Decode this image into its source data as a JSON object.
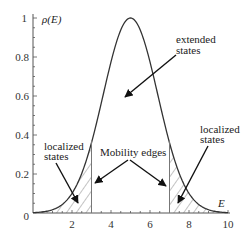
{
  "chart_data": {
    "type": "line",
    "title": "",
    "xlabel": "E",
    "ylabel": "ρ(E)",
    "xlim": [
      0,
      10
    ],
    "ylim": [
      0,
      1
    ],
    "x_ticks": [
      "2",
      "4",
      "6",
      "8",
      "10"
    ],
    "y_ticks": [
      "0",
      "0.2",
      "0.4",
      "0.6",
      "0.8",
      "1"
    ],
    "grid": false,
    "legend": null,
    "series": [
      {
        "name": "density of states",
        "x": [
          0,
          0.5,
          1,
          1.5,
          2,
          2.5,
          3,
          3.5,
          4,
          4.5,
          5,
          5.5,
          6,
          6.5,
          7,
          7.5,
          8,
          8.5,
          9,
          9.5,
          10
        ],
        "values": [
          0.002,
          0.006,
          0.017,
          0.044,
          0.101,
          0.203,
          0.36,
          0.563,
          0.775,
          0.938,
          1.0,
          0.938,
          0.775,
          0.563,
          0.36,
          0.203,
          0.101,
          0.044,
          0.017,
          0.006,
          0.002
        ]
      }
    ],
    "mobility_edges": [
      3,
      7
    ],
    "shaded_regions": [
      {
        "from": 0,
        "to": 3,
        "label": "localized states"
      },
      {
        "from": 7,
        "to": 10,
        "label": "localized states"
      }
    ],
    "annotations": [
      {
        "text": "extended states",
        "points_to_x": 4.5,
        "points_to_y": 0.45
      },
      {
        "text": "Mobility edges",
        "points_to": [
          3,
          7
        ]
      },
      {
        "text": "localized states",
        "points_to_x": 2,
        "points_to_y": 0.05
      },
      {
        "text": "localized states",
        "points_to_x": 7.6,
        "points_to_y": 0.05
      }
    ]
  },
  "labels": {
    "ylabel": "ρ(E)",
    "xlabel": "E",
    "extended_1": "extended",
    "extended_2": "states",
    "mobility": "Mobility edges",
    "loc_left_1": "localized",
    "loc_left_2": "states",
    "loc_right_1": "localized",
    "loc_right_2": "states",
    "x0": "0",
    "x2": "2",
    "x4": "4",
    "x6": "6",
    "x8": "8",
    "x10": "10",
    "y02": "0.2",
    "y04": "0.4",
    "y06": "0.6",
    "y08": "0.8",
    "y1": "1"
  }
}
